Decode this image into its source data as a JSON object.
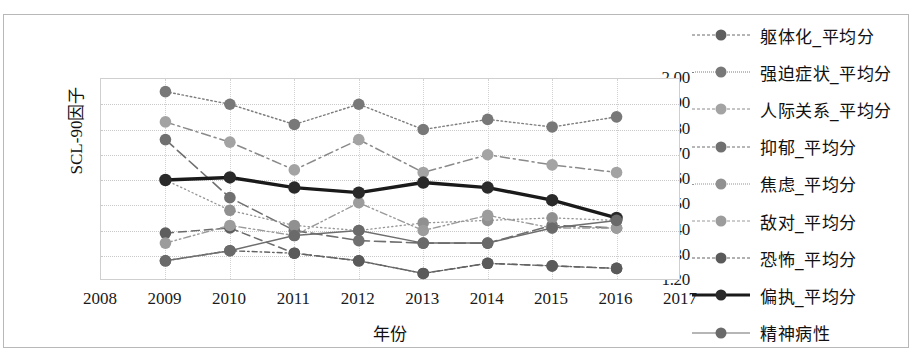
{
  "chart_data": {
    "type": "line",
    "title": "",
    "xlabel": "年份",
    "ylabel": "SCL-90因子",
    "x": [
      2009,
      2010,
      2011,
      2012,
      2013,
      2014,
      2015,
      2016
    ],
    "xticks": [
      "2008",
      "2009",
      "2010",
      "2011",
      "2012",
      "2013",
      "2014",
      "2015",
      "2016",
      "2017"
    ],
    "yticks": [
      "2.00",
      "1.90",
      "1.80",
      "1.70",
      "1.60",
      "1.50",
      "1.40",
      "1.30",
      "1.20"
    ],
    "xlim": [
      2008,
      2017
    ],
    "ylim": [
      1.2,
      2.0
    ],
    "grid": true,
    "legend_position": "right",
    "series": [
      {
        "name": "躯体化_平均分",
        "style": "dashed",
        "color": "#6b6b6b",
        "marker_color": "#5e5e5e",
        "values": [
          1.39,
          1.41,
          1.31,
          1.28,
          1.23,
          1.27,
          1.26,
          1.25
        ]
      },
      {
        "name": "强迫症状_平均分",
        "style": "dotted",
        "color": "#7d7d7d",
        "marker_color": "#787878",
        "values": [
          1.95,
          1.9,
          1.82,
          1.9,
          1.8,
          1.84,
          1.81,
          1.85
        ]
      },
      {
        "name": "人际关系_平均分",
        "style": "dashdot",
        "color": "#8a8a8a",
        "marker_color": "#a3a3a3",
        "values": [
          1.83,
          1.75,
          1.64,
          1.76,
          1.63,
          1.7,
          1.66,
          1.63
        ]
      },
      {
        "name": "抑郁_平均分",
        "style": "dashed-long",
        "color": "#6f6f6f",
        "marker_color": "#707070",
        "values": [
          1.76,
          1.53,
          1.4,
          1.36,
          1.35,
          1.35,
          1.42,
          1.41
        ]
      },
      {
        "name": "焦虑_平均分",
        "style": "dotted-fine",
        "color": "#949494",
        "marker_color": "#909090",
        "values": [
          1.6,
          1.48,
          1.42,
          1.4,
          1.43,
          1.44,
          1.45,
          1.44
        ]
      },
      {
        "name": "敌对_平均分",
        "style": "dashdotdot",
        "color": "#9a9a9a",
        "marker_color": "#9c9c9c",
        "values": [
          1.35,
          1.42,
          1.38,
          1.51,
          1.4,
          1.46,
          1.41,
          1.41
        ]
      },
      {
        "name": "恐怖_平均分",
        "style": "dashdot-short",
        "color": "#636363",
        "marker_color": "#5a5a5a",
        "values": [
          1.28,
          1.32,
          1.31,
          1.28,
          1.23,
          1.27,
          1.26,
          1.25
        ]
      },
      {
        "name": "偏执_平均分",
        "style": "solid-thick",
        "color": "#1a1a1a",
        "marker_color": "#2a2a2a",
        "values": [
          1.6,
          1.61,
          1.57,
          1.55,
          1.59,
          1.57,
          1.52,
          1.45
        ]
      },
      {
        "name": "精神病性",
        "style": "solid",
        "color": "#6e6e6e",
        "marker_color": "#6a6a6a",
        "values": [
          1.28,
          1.32,
          1.38,
          1.4,
          1.35,
          1.35,
          1.41,
          1.44
        ]
      }
    ]
  }
}
